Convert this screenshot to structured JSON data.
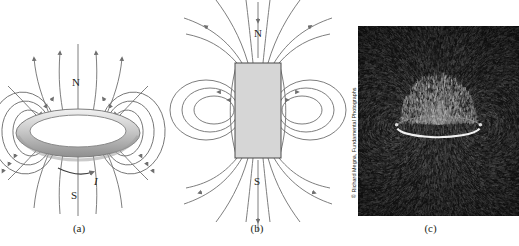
{
  "figure": {
    "background_color": "#ffffff",
    "field_line_color": "#6f6f6f",
    "label_color": "#231f20"
  },
  "panels": [
    {
      "id": "a",
      "caption": "(a)",
      "kind": "current-loop-field-diagram",
      "labels": {
        "north_pole": "N",
        "south_pole": "S",
        "current": "I"
      },
      "loop": {
        "fill_light": "#e8e8e8",
        "fill_dark": "#9a9a9a",
        "stroke": "#6f6f6f"
      }
    },
    {
      "id": "b",
      "caption": "(b)",
      "kind": "bar-magnet-field-diagram",
      "labels": {
        "north_pole": "N",
        "south_pole": "S"
      },
      "magnet": {
        "fill": "#d6d6d6",
        "stroke": "#4a4a4a"
      }
    },
    {
      "id": "c",
      "caption": "(c)",
      "kind": "iron-filings-photograph",
      "credit": "© Richard Megna, Fundamental Photographs",
      "photo": {
        "base_color": "#141414",
        "filing_color": "#b4b4b4",
        "loop_color": "#f0f0f0"
      }
    }
  ]
}
